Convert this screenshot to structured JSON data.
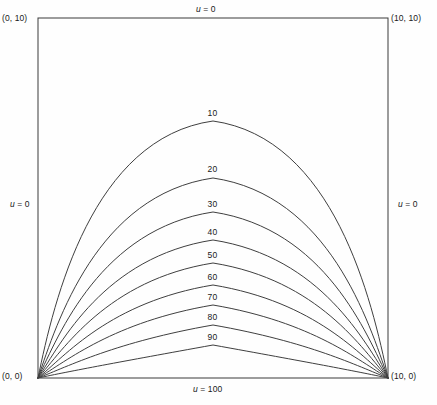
{
  "figure": {
    "type": "contour-plot"
  },
  "corners": {
    "top_left": "(0, 10)",
    "top_right": "(10, 10)",
    "bottom_left": "(0, 0)",
    "bottom_right": "(10, 0)"
  },
  "boundary_conditions": {
    "top": {
      "var": "u",
      "eq": " = 0"
    },
    "left": {
      "var": "u",
      "eq": " = 0"
    },
    "right": {
      "var": "u",
      "eq": " = 0"
    },
    "bottom": {
      "var": "u",
      "eq": " = 100"
    }
  },
  "chart_data": {
    "type": "line",
    "title": "",
    "xlabel": "",
    "ylabel": "",
    "xlim": [
      0,
      10
    ],
    "ylim": [
      0,
      10
    ],
    "grid": false,
    "legend": "none",
    "annotations": [
      "(0, 10)",
      "(10, 10)",
      "(0, 0)",
      "(10, 0)",
      "u = 0",
      "u = 0",
      "u = 0",
      "u = 100"
    ],
    "contour_levels": [
      10,
      20,
      30,
      40,
      50,
      60,
      70,
      80,
      90
    ],
    "contour_label_values": [
      "10",
      "20",
      "30",
      "40",
      "50",
      "60",
      "70",
      "80",
      "90"
    ],
    "contours": [
      {
        "level": 10,
        "peak_x": 5.0,
        "peak_y": 7.15,
        "label": "10"
      },
      {
        "level": 20,
        "peak_x": 5.0,
        "peak_y": 5.57,
        "label": "20"
      },
      {
        "level": 30,
        "peak_x": 5.0,
        "peak_y": 4.61,
        "label": "30"
      },
      {
        "level": 40,
        "peak_x": 5.0,
        "peak_y": 3.83,
        "label": "40"
      },
      {
        "level": 50,
        "peak_x": 5.0,
        "peak_y": 3.19,
        "label": "50"
      },
      {
        "level": 60,
        "peak_x": 5.0,
        "peak_y": 2.58,
        "label": "60"
      },
      {
        "level": 70,
        "peak_x": 5.0,
        "peak_y": 2.03,
        "label": "70"
      },
      {
        "level": 80,
        "peak_x": 5.0,
        "peak_y": 1.47,
        "label": "80"
      },
      {
        "level": 90,
        "peak_x": 5.0,
        "peak_y": 0.92,
        "label": "90"
      }
    ]
  },
  "style": {
    "frame_color": "#3a3a3a",
    "curve_color": "#3f3f3f",
    "text_color": "#1a1a1a",
    "background": "#fefefe"
  }
}
